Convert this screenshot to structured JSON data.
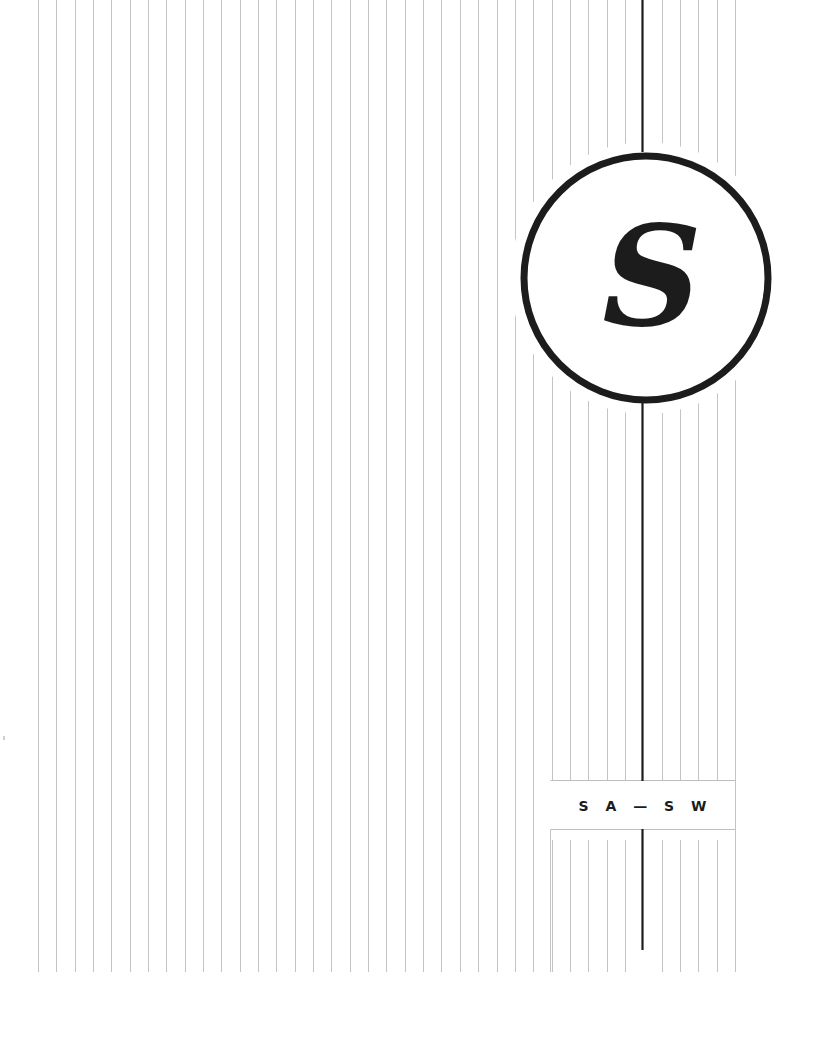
{
  "section": {
    "letter": "S",
    "range_label": "S A — S W",
    "range_start": "SA",
    "range_end": "SW"
  },
  "colors": {
    "background": "#ffffff",
    "rule_thin": "#c4c4c4",
    "rule_thick": "#1c1c1c",
    "circle_stroke": "#1c1c1c",
    "letter": "#1c1c1c",
    "label": "#1c1c1c",
    "box_border": "#bdbdbd"
  },
  "layout": {
    "rule_count": 39,
    "rule_first_x": 38,
    "rule_spacing": 18.34,
    "thick_rule_x": 642,
    "circle": {
      "cx": 646,
      "cy": 278,
      "r": 122,
      "stroke_width": 7
    }
  }
}
